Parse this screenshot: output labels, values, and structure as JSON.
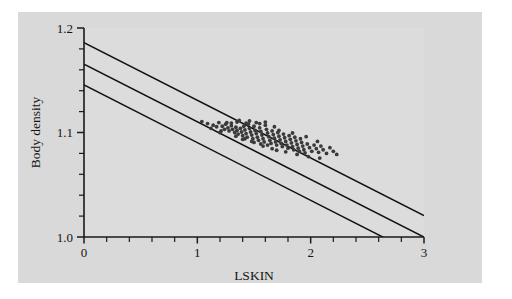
{
  "figure": {
    "background_color": "#d9d9d9",
    "page_color": "#ffffff",
    "plot_area_color": "#dcdcdc",
    "axis_color": "#1a1a1a",
    "line_color": "#101010",
    "point_color": "#3a3a3a",
    "gray_panel": {
      "x": 18,
      "y": 12,
      "width": 464,
      "height": 271
    },
    "plot_frame": {
      "left": 84,
      "top": 28,
      "right": 424,
      "bottom": 237
    }
  },
  "chart_data": {
    "type": "scatter",
    "title": "",
    "subtitle": "",
    "xlabel": "LSKIN",
    "ylabel": "Body density",
    "xlim": [
      0,
      3
    ],
    "ylim": [
      1.0,
      1.2
    ],
    "grid": false,
    "legend": null,
    "legend_position": "none",
    "x_ticks_major": [
      0,
      1,
      2,
      3
    ],
    "x_tick_labels": [
      "0",
      "1",
      "2",
      "3"
    ],
    "x_ticks_minor": [
      0.2,
      0.4,
      0.6,
      0.8,
      1.2,
      1.4,
      1.6,
      1.8,
      2.2,
      2.4,
      2.6,
      2.8
    ],
    "y_ticks_major": [
      1.0,
      1.1,
      1.2
    ],
    "y_tick_labels": [
      "1.0",
      "1.1",
      "1.2"
    ],
    "y_ticks_minor": [
      1.02,
      1.04,
      1.06,
      1.08,
      1.12,
      1.14,
      1.16,
      1.18
    ],
    "annotations": [],
    "lines": [
      {
        "name": "upper-band",
        "label": "Upper prediction band",
        "intercept": 1.186,
        "slope": -0.0552,
        "x_start": 0,
        "x_end": 3.0
      },
      {
        "name": "regression-line",
        "label": "Fitted regression line",
        "intercept": 1.1655,
        "slope": -0.0552,
        "x_start": 0,
        "x_end": 3.0
      },
      {
        "name": "lower-band",
        "label": "Lower prediction band",
        "intercept": 1.1455,
        "slope": -0.0552,
        "x_start": 0,
        "x_end": 3.0
      }
    ],
    "series": [
      {
        "name": "observations",
        "label": "Body density vs LSKIN",
        "marker": "circle",
        "points": [
          [
            1.04,
            1.1105
          ],
          [
            1.09,
            1.1085
          ],
          [
            1.14,
            1.107
          ],
          [
            1.17,
            1.1055
          ],
          [
            1.19,
            1.1095
          ],
          [
            1.22,
            1.106
          ],
          [
            1.24,
            1.103
          ],
          [
            1.25,
            1.108
          ],
          [
            1.27,
            1.1045
          ],
          [
            1.28,
            1.1015
          ],
          [
            1.3,
            1.1065
          ],
          [
            1.31,
            1.103
          ],
          [
            1.33,
            1.1
          ],
          [
            1.34,
            1.105
          ],
          [
            1.35,
            1.102
          ],
          [
            1.36,
            1.0985
          ],
          [
            1.37,
            1.1115
          ],
          [
            1.38,
            1.104
          ],
          [
            1.39,
            1.1005
          ],
          [
            1.4,
            1.097
          ],
          [
            1.41,
            1.106
          ],
          [
            1.42,
            1.1025
          ],
          [
            1.43,
            1.099
          ],
          [
            1.44,
            1.0955
          ],
          [
            1.45,
            1.108
          ],
          [
            1.46,
            1.104
          ],
          [
            1.47,
            1.1005
          ],
          [
            1.48,
            1.0975
          ],
          [
            1.49,
            1.094
          ],
          [
            1.5,
            1.106
          ],
          [
            1.51,
            1.102
          ],
          [
            1.52,
            1.099
          ],
          [
            1.53,
            1.0955
          ],
          [
            1.54,
            1.0925
          ],
          [
            1.55,
            1.1045
          ],
          [
            1.56,
            1.101
          ],
          [
            1.57,
            1.0975
          ],
          [
            1.58,
            1.094
          ],
          [
            1.59,
            1.091
          ],
          [
            1.6,
            1.11
          ],
          [
            1.61,
            1.103
          ],
          [
            1.62,
            1.0995
          ],
          [
            1.63,
            1.096
          ],
          [
            1.64,
            1.0925
          ],
          [
            1.65,
            1.0895
          ],
          [
            1.66,
            1.1015
          ],
          [
            1.67,
            1.098
          ],
          [
            1.68,
            1.0945
          ],
          [
            1.69,
            1.091
          ],
          [
            1.7,
            1.088
          ],
          [
            1.71,
            1.1
          ],
          [
            1.72,
            1.0965
          ],
          [
            1.73,
            1.093
          ],
          [
            1.74,
            1.0895
          ],
          [
            1.75,
            1.0865
          ],
          [
            1.76,
            1.0985
          ],
          [
            1.77,
            1.095
          ],
          [
            1.78,
            1.0915
          ],
          [
            1.79,
            1.088
          ],
          [
            1.8,
            1.085
          ],
          [
            1.81,
            1.097
          ],
          [
            1.82,
            1.0935
          ],
          [
            1.83,
            1.09
          ],
          [
            1.84,
            1.0865
          ],
          [
            1.85,
            1.0835
          ],
          [
            1.86,
            1.0955
          ],
          [
            1.87,
            1.092
          ],
          [
            1.88,
            1.0885
          ],
          [
            1.89,
            1.085
          ],
          [
            1.9,
            1.082
          ],
          [
            1.91,
            1.094
          ],
          [
            1.92,
            1.0905
          ],
          [
            1.93,
            1.087
          ],
          [
            1.94,
            1.0835
          ],
          [
            1.95,
            1.0805
          ],
          [
            1.97,
            1.089
          ],
          [
            1.99,
            1.0855
          ],
          [
            2.01,
            1.082
          ],
          [
            2.03,
            1.088
          ],
          [
            2.05,
            1.0845
          ],
          [
            2.07,
            1.081
          ],
          [
            2.09,
            1.087
          ],
          [
            2.11,
            1.0835
          ],
          [
            2.14,
            1.08
          ],
          [
            2.17,
            1.0855
          ],
          [
            2.2,
            1.082
          ],
          [
            2.23,
            1.079
          ],
          [
            1.43,
            1.109
          ],
          [
            1.52,
            1.1095
          ],
          [
            1.6,
            1.107
          ],
          [
            1.35,
            1.11
          ],
          [
            1.46,
            1.111
          ],
          [
            1.68,
            1.1055
          ],
          [
            1.3,
            1.109
          ],
          [
            1.55,
            1.1085
          ],
          [
            1.72,
            1.102
          ],
          [
            1.84,
            1.0995
          ],
          [
            1.96,
            1.096
          ],
          [
            2.06,
            1.0915
          ],
          [
            1.12,
            1.104
          ],
          [
            1.21,
            1.1015
          ],
          [
            1.26,
            1.1095
          ],
          [
            1.58,
            1.087
          ],
          [
            1.66,
            1.0845
          ],
          [
            1.78,
            1.0815
          ],
          [
            1.88,
            1.079
          ],
          [
            1.98,
            1.077
          ],
          [
            2.08,
            1.0755
          ],
          [
            1.5,
            1.0905
          ],
          [
            1.62,
            1.088
          ],
          [
            1.7,
            1.083
          ],
          [
            1.42,
            1.094
          ],
          [
            1.48,
            1.0915
          ],
          [
            1.56,
            1.089
          ],
          [
            1.34,
            1.0965
          ],
          [
            1.4,
            1.0935
          ],
          [
            1.2,
            1.1
          ]
        ]
      }
    ]
  }
}
